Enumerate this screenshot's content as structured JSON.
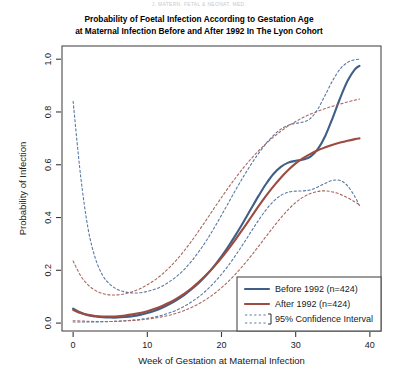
{
  "figure": {
    "running_head": "J. MATERN. FETAL & NEONAT. MED.",
    "title_line1": "Probability of Foetal Infection According to Gestation Age",
    "title_line2": "at Maternal Infection Before and After 1992 In The Lyon Cohort"
  },
  "colors": {
    "before_1992": "#3f5f86",
    "after_1992": "#9d4a40",
    "axis": "#3a3a3a",
    "frame": "#4a4a4a",
    "background": "#ffffff",
    "ci_blue": "#5878a5",
    "ci_red": "#a9675f"
  },
  "legend": {
    "items": [
      {
        "label": "Before 1992 (n=424)",
        "style": "solid",
        "color": "#3f5f86"
      },
      {
        "label": "After 1992 (n=424)",
        "style": "solid",
        "color": "#9d4a40"
      },
      {
        "label": "95% Confidence Interval",
        "style": "dashed",
        "color": "#5878a5"
      }
    ]
  },
  "chart_data": {
    "type": "line",
    "title": "Probability of Foetal Infection According to Gestation Age at Maternal Infection Before and After 1992 In The Lyon Cohort",
    "xlabel": "Week of Gestation at Maternal Infection",
    "ylabel": "Probability of Infection",
    "xlim": [
      -1.5,
      41.5
    ],
    "ylim": [
      -0.03,
      1.05
    ],
    "xticks": [
      0,
      10,
      20,
      30,
      40
    ],
    "yticks": [
      0.0,
      0.2,
      0.4,
      0.6,
      0.8,
      1.0
    ],
    "ytick_labels": [
      "0.0",
      "0.2",
      "0.4",
      "0.6",
      "0.8",
      "1.0"
    ],
    "xtick_labels": [
      "0",
      "10",
      "20",
      "30",
      "40"
    ],
    "grid": false,
    "legend_position": "bottom-right",
    "x": [
      0,
      1,
      2,
      3,
      4,
      5,
      6,
      7,
      8,
      9,
      10,
      11,
      12,
      13,
      14,
      15,
      16,
      17,
      18,
      19,
      20,
      21,
      22,
      23,
      24,
      25,
      26,
      27,
      28,
      29,
      30,
      31,
      32,
      33,
      34,
      35,
      36,
      37,
      38,
      38.6
    ],
    "series": [
      {
        "name": "Before 1992 (n=424)",
        "color": "#3f5f86",
        "style": "solid",
        "values": [
          0.055,
          0.04,
          0.03,
          0.025,
          0.022,
          0.021,
          0.021,
          0.023,
          0.026,
          0.031,
          0.038,
          0.047,
          0.058,
          0.072,
          0.088,
          0.107,
          0.129,
          0.154,
          0.183,
          0.216,
          0.253,
          0.294,
          0.338,
          0.385,
          0.434,
          0.482,
          0.527,
          0.565,
          0.592,
          0.608,
          0.615,
          0.62,
          0.631,
          0.66,
          0.71,
          0.779,
          0.853,
          0.918,
          0.962,
          0.975
        ]
      },
      {
        "name": "Before 1992 upper 95% CI",
        "color": "#5878a5",
        "style": "dashed",
        "values": [
          0.84,
          0.56,
          0.36,
          0.245,
          0.18,
          0.146,
          0.127,
          0.118,
          0.114,
          0.115,
          0.12,
          0.128,
          0.14,
          0.157,
          0.178,
          0.204,
          0.236,
          0.273,
          0.314,
          0.36,
          0.409,
          0.459,
          0.509,
          0.557,
          0.602,
          0.643,
          0.68,
          0.711,
          0.735,
          0.75,
          0.757,
          0.762,
          0.776,
          0.812,
          0.865,
          0.92,
          0.963,
          0.988,
          0.998,
          1.0
        ]
      },
      {
        "name": "Before 1992 lower 95% CI",
        "color": "#5878a5",
        "style": "dashed",
        "values": [
          0.004,
          0.004,
          0.004,
          0.004,
          0.005,
          0.006,
          0.007,
          0.009,
          0.011,
          0.014,
          0.018,
          0.023,
          0.03,
          0.039,
          0.05,
          0.064,
          0.081,
          0.101,
          0.125,
          0.153,
          0.185,
          0.221,
          0.261,
          0.303,
          0.347,
          0.39,
          0.429,
          0.461,
          0.484,
          0.496,
          0.5,
          0.501,
          0.505,
          0.516,
          0.53,
          0.541,
          0.54,
          0.52,
          0.478,
          0.445
        ]
      },
      {
        "name": "After 1992 (n=424)",
        "color": "#9d4a40",
        "style": "solid",
        "values": [
          0.05,
          0.038,
          0.031,
          0.027,
          0.025,
          0.025,
          0.026,
          0.029,
          0.033,
          0.038,
          0.045,
          0.054,
          0.065,
          0.078,
          0.094,
          0.112,
          0.133,
          0.157,
          0.184,
          0.214,
          0.247,
          0.283,
          0.321,
          0.361,
          0.402,
          0.443,
          0.482,
          0.518,
          0.551,
          0.58,
          0.605,
          0.625,
          0.641,
          0.655,
          0.666,
          0.676,
          0.684,
          0.691,
          0.697,
          0.7
        ]
      },
      {
        "name": "After 1992 upper 95% CI",
        "color": "#a9675f",
        "style": "dashed",
        "values": [
          0.235,
          0.18,
          0.145,
          0.124,
          0.112,
          0.107,
          0.107,
          0.111,
          0.119,
          0.13,
          0.145,
          0.163,
          0.185,
          0.211,
          0.241,
          0.275,
          0.312,
          0.352,
          0.393,
          0.435,
          0.476,
          0.516,
          0.554,
          0.59,
          0.623,
          0.653,
          0.68,
          0.705,
          0.727,
          0.747,
          0.764,
          0.779,
          0.792,
          0.803,
          0.813,
          0.822,
          0.83,
          0.838,
          0.845,
          0.849
        ]
      },
      {
        "name": "After 1992 lower 95% CI",
        "color": "#a9675f",
        "style": "dashed",
        "values": [
          0.009,
          0.008,
          0.007,
          0.006,
          0.006,
          0.006,
          0.007,
          0.008,
          0.01,
          0.012,
          0.015,
          0.019,
          0.024,
          0.03,
          0.038,
          0.048,
          0.06,
          0.074,
          0.091,
          0.111,
          0.134,
          0.16,
          0.189,
          0.221,
          0.255,
          0.291,
          0.328,
          0.364,
          0.399,
          0.43,
          0.457,
          0.477,
          0.491,
          0.499,
          0.501,
          0.497,
          0.488,
          0.475,
          0.459,
          0.448
        ]
      }
    ]
  }
}
